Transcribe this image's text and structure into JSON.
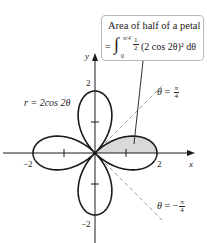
{
  "figure": {
    "type": "polar-rose-area",
    "curve_label": "r = 2cos 2θ",
    "curve": {
      "a": 2,
      "k": 2,
      "function": "r = a cos(kθ)"
    },
    "shaded_region": {
      "theta_from": 0,
      "theta_to": 0.7853981634,
      "fill": "#d9d9d9",
      "description": "half of right petal, 0 ≤ θ ≤ π/4"
    }
  },
  "axes": {
    "x_label": "x",
    "y_label": "y",
    "ticks": {
      "x_pos": "2",
      "x_neg": "−2",
      "y_pos": "2",
      "y_neg": "−2"
    },
    "origin_px": [
      95,
      153
    ],
    "scale_px_per_unit": 31,
    "x_range_px": [
      3,
      195
    ],
    "y_range_px": [
      53,
      243
    ]
  },
  "rays": [
    {
      "name": "theta-pi-over-4",
      "symbol": "θ",
      "eq": "=",
      "numerator": "π",
      "denominator": "4",
      "sign": "",
      "angle_deg": 45,
      "length_px": 96
    },
    {
      "name": "theta-neg-pi-over-4",
      "symbol": "θ",
      "eq": "=",
      "numerator": "π",
      "denominator": "4",
      "sign": "−",
      "angle_deg": -45,
      "length_px": 96
    }
  ],
  "callout": {
    "title": "Area of half of a petal",
    "equals": "=",
    "integral_sign": "∫",
    "upper_limit": "π/4",
    "lower_limit": "0",
    "coef_num": "1",
    "coef_den": "2",
    "integrand": "(2 cos 2θ)² dθ",
    "border_color": "#b8b8b8"
  },
  "colors": {
    "curve": "#1a1a1a",
    "axes": "#1a1a1a",
    "rays": "#9a9a9a",
    "shade": "#d9d9d9",
    "leader": "#333333"
  }
}
